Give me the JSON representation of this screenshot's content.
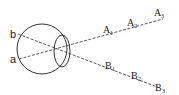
{
  "diagram": {
    "eye_labels": {
      "top": "b",
      "bottom": "a"
    },
    "ray_a": {
      "labels": [
        {
          "main": "A",
          "sub": "1"
        },
        {
          "main": "A",
          "sub": "2"
        },
        {
          "main": "A",
          "sub": "3"
        }
      ]
    },
    "ray_b": {
      "labels": [
        {
          "main": "B",
          "sub": "1"
        },
        {
          "main": "B",
          "sub": "2"
        },
        {
          "main": "B",
          "sub": "3"
        }
      ]
    },
    "colors": {
      "stroke": "#333333",
      "background": "#ffffff"
    }
  }
}
